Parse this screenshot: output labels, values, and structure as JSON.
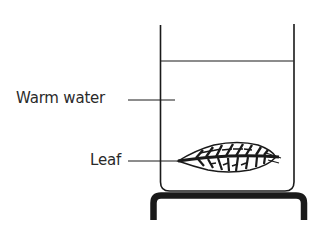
{
  "diagram": {
    "type": "experimental-setup",
    "labels": {
      "warm_water": "Warm water",
      "leaf": "Leaf"
    },
    "components": [
      {
        "name": "beaker",
        "role": "container"
      },
      {
        "name": "water-surface",
        "role": "liquid level"
      },
      {
        "name": "leaf",
        "role": "specimen submerged in water"
      },
      {
        "name": "stand",
        "role": "support under beaker"
      }
    ],
    "colors": {
      "line": "#1a1a1a",
      "text": "#2a2a2a",
      "background": "#ffffff"
    }
  }
}
